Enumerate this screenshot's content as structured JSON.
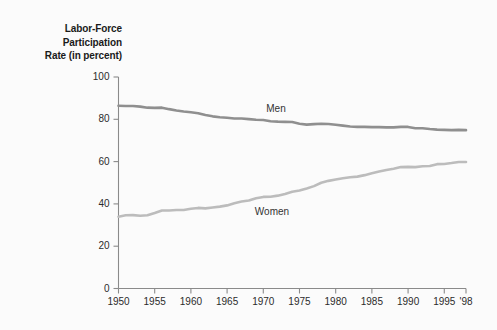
{
  "title": {
    "line1": "Labor-Force",
    "line2": "Participation",
    "line3": "Rate (in percent)"
  },
  "colors": {
    "men_line": "#8f8f8f",
    "women_line": "#bcbcbc",
    "axis": "#8a8a8a",
    "text": "#2b2b2b",
    "background": "#fbfbfb"
  },
  "axis": {
    "y_ticks": [
      "0",
      "20",
      "40",
      "60",
      "80",
      "100"
    ],
    "x_ticks": [
      "1950",
      "1955",
      "1960",
      "1965",
      "1970",
      "1975",
      "1980",
      "1985",
      "1990",
      "1995",
      "'98"
    ]
  },
  "labels": {
    "men": "Men",
    "women": "Women"
  },
  "chart_data": {
    "type": "line",
    "title": "Labor-Force Participation Rate (in percent)",
    "xlabel": "",
    "ylabel": "Labor-Force Participation Rate (in percent)",
    "xlim": [
      1950,
      1998
    ],
    "ylim": [
      0,
      100
    ],
    "grid": false,
    "legend": "inline-labels",
    "x": [
      1950,
      1951,
      1952,
      1953,
      1954,
      1955,
      1956,
      1957,
      1958,
      1959,
      1960,
      1961,
      1962,
      1963,
      1964,
      1965,
      1966,
      1967,
      1968,
      1969,
      1970,
      1971,
      1972,
      1973,
      1974,
      1975,
      1976,
      1977,
      1978,
      1979,
      1980,
      1981,
      1982,
      1983,
      1984,
      1985,
      1986,
      1987,
      1988,
      1989,
      1990,
      1991,
      1992,
      1993,
      1994,
      1995,
      1996,
      1997,
      1998
    ],
    "series": [
      {
        "name": "Men",
        "color": "#8f8f8f",
        "values": [
          86.4,
          86.3,
          86.3,
          86.0,
          85.5,
          85.4,
          85.5,
          84.8,
          84.2,
          83.7,
          83.3,
          82.9,
          82.0,
          81.4,
          81.0,
          80.7,
          80.4,
          80.4,
          80.1,
          79.8,
          79.7,
          79.1,
          78.9,
          78.8,
          78.7,
          77.9,
          77.5,
          77.7,
          77.9,
          77.8,
          77.4,
          77.0,
          76.6,
          76.4,
          76.4,
          76.3,
          76.3,
          76.2,
          76.2,
          76.4,
          76.4,
          75.8,
          75.8,
          75.4,
          75.1,
          75.0,
          74.9,
          75.0,
          74.9
        ]
      },
      {
        "name": "Women",
        "color": "#bcbcbc",
        "values": [
          33.9,
          34.6,
          34.7,
          34.4,
          34.6,
          35.7,
          36.9,
          36.9,
          37.1,
          37.1,
          37.7,
          38.1,
          37.9,
          38.3,
          38.7,
          39.3,
          40.3,
          41.1,
          41.6,
          42.7,
          43.3,
          43.4,
          43.9,
          44.7,
          45.7,
          46.3,
          47.3,
          48.4,
          50.0,
          50.9,
          51.5,
          52.1,
          52.6,
          52.9,
          53.6,
          54.5,
          55.3,
          56.0,
          56.6,
          57.4,
          57.5,
          57.4,
          57.8,
          57.9,
          58.8,
          58.9,
          59.3,
          59.8,
          59.8
        ]
      }
    ]
  }
}
